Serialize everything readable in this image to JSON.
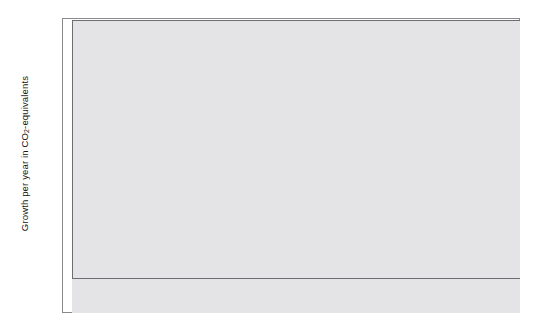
{
  "chart_data": {
    "type": "area",
    "stacked": true,
    "title": "",
    "xlabel": "",
    "ylabel": "Growth per year in CO2-equivalents",
    "ylabel_html": "Growth per year in CO<sub>2</sub>-equivalents",
    "xlim": [
      1850,
      1995
    ],
    "ylim": [
      -0.1,
      0.8
    ],
    "y_tick_labels": [
      "0.8%",
      "0.7%",
      "0.6%",
      "0.5%",
      "0.4%",
      "0.3%",
      "0.2%",
      "0.1%",
      "0.0%",
      "-0.1%"
    ],
    "y_tick_values": [
      0.8,
      0.7,
      0.6,
      0.5,
      0.4,
      0.3,
      0.2,
      0.1,
      0.0,
      -0.1
    ],
    "x_tick_labels": [
      "1860",
      "1870",
      "1880",
      "1890",
      "1900",
      "1910",
      "1920",
      "1930",
      "1940",
      "1950",
      "1960",
      "1970",
      "1980",
      "1990"
    ],
    "x_tick_values": [
      1860,
      1870,
      1880,
      1890,
      1900,
      1910,
      1920,
      1930,
      1940,
      1950,
      1960,
      1970,
      1980,
      1990
    ],
    "grid": "faint-white-horizontal-and-vertical",
    "legend_position": "upper-left-inside",
    "plot_background_color": "#e4e4e6",
    "series": [
      {
        "name": "Carbon dioxide",
        "color": "#ffffff",
        "stack_order": 1,
        "values": [
          0.0,
          -0.012,
          -0.015,
          0.01,
          0.048,
          0.082,
          0.1,
          0.104,
          0.092,
          0.078,
          0.064,
          0.052,
          0.046,
          0.044,
          0.044,
          0.045,
          0.047,
          0.049,
          0.05,
          0.052,
          0.056,
          0.06,
          0.064,
          0.062,
          0.06,
          0.062,
          0.07,
          0.088,
          0.112,
          0.142,
          0.172,
          0.192,
          0.2,
          0.188,
          0.176,
          0.166,
          0.156,
          0.146,
          0.134,
          0.12,
          0.104,
          0.09,
          0.078,
          0.07,
          0.064,
          0.062,
          0.066,
          0.08,
          0.098,
          0.118,
          0.136,
          0.148,
          0.154,
          0.156,
          0.154,
          0.15,
          0.148,
          0.15,
          0.154,
          0.156,
          0.156,
          0.152,
          0.146,
          0.142,
          0.14,
          0.142,
          0.146,
          0.15,
          0.154,
          0.158,
          0.16,
          0.16,
          0.158,
          0.156,
          0.156,
          0.158,
          0.162,
          0.166,
          0.168,
          0.17,
          0.172,
          0.172,
          0.17,
          0.166,
          0.16,
          0.15,
          0.134,
          0.112,
          0.082,
          0.044,
          0.004,
          -0.03,
          -0.048,
          -0.046,
          -0.026,
          0.006,
          0.04,
          0.072,
          0.098,
          0.118,
          0.134,
          0.148,
          0.16,
          0.172,
          0.184,
          0.196,
          0.206,
          0.216,
          0.222,
          0.216,
          0.226,
          0.244,
          0.258,
          0.25,
          0.262,
          0.282,
          0.3,
          0.312,
          0.322,
          0.318,
          0.33,
          0.352,
          0.368,
          0.36,
          0.346,
          0.356,
          0.378,
          0.392,
          0.4,
          0.392,
          0.372,
          0.352,
          0.34,
          0.332,
          0.344,
          0.366,
          0.38,
          0.368,
          0.352,
          0.342,
          0.35,
          0.368,
          0.39,
          0.404,
          0.398,
          0.386
        ]
      },
      {
        "name": "Methane",
        "color": "#d2d2d4",
        "stack_order": 2,
        "values": [
          0.0,
          0.0,
          0.0,
          0.002,
          0.004,
          0.006,
          0.007,
          0.007,
          0.007,
          0.006,
          0.006,
          0.006,
          0.006,
          0.006,
          0.006,
          0.006,
          0.006,
          0.007,
          0.007,
          0.007,
          0.008,
          0.008,
          0.008,
          0.008,
          0.008,
          0.008,
          0.009,
          0.01,
          0.011,
          0.012,
          0.013,
          0.014,
          0.014,
          0.014,
          0.014,
          0.013,
          0.013,
          0.013,
          0.012,
          0.012,
          0.011,
          0.011,
          0.01,
          0.01,
          0.01,
          0.01,
          0.01,
          0.011,
          0.012,
          0.013,
          0.014,
          0.015,
          0.015,
          0.015,
          0.015,
          0.015,
          0.015,
          0.015,
          0.015,
          0.016,
          0.016,
          0.016,
          0.015,
          0.015,
          0.015,
          0.015,
          0.015,
          0.016,
          0.016,
          0.016,
          0.017,
          0.017,
          0.017,
          0.017,
          0.017,
          0.017,
          0.017,
          0.018,
          0.018,
          0.018,
          0.018,
          0.018,
          0.018,
          0.018,
          0.017,
          0.016,
          0.015,
          0.013,
          0.011,
          0.008,
          0.005,
          0.003,
          0.002,
          0.002,
          0.003,
          0.006,
          0.01,
          0.014,
          0.018,
          0.022,
          0.026,
          0.03,
          0.034,
          0.038,
          0.042,
          0.046,
          0.05,
          0.054,
          0.057,
          0.058,
          0.06,
          0.063,
          0.066,
          0.066,
          0.068,
          0.071,
          0.074,
          0.076,
          0.078,
          0.078,
          0.08,
          0.083,
          0.086,
          0.086,
          0.084,
          0.086,
          0.089,
          0.091,
          0.092,
          0.091,
          0.088,
          0.085,
          0.083,
          0.082,
          0.084,
          0.087,
          0.089,
          0.087,
          0.085,
          0.084,
          0.085,
          0.088,
          0.091,
          0.093,
          0.092,
          0.09
        ]
      },
      {
        "name": "Nitrous oxide",
        "color": "#8e8e92",
        "stack_order": 3,
        "values": [
          0.0,
          0.0,
          0.0,
          0.001,
          0.002,
          0.003,
          0.004,
          0.004,
          0.004,
          0.004,
          0.004,
          0.004,
          0.004,
          0.004,
          0.004,
          0.004,
          0.004,
          0.004,
          0.004,
          0.004,
          0.005,
          0.005,
          0.005,
          0.005,
          0.005,
          0.005,
          0.005,
          0.006,
          0.006,
          0.007,
          0.008,
          0.008,
          0.008,
          0.008,
          0.008,
          0.008,
          0.008,
          0.008,
          0.007,
          0.007,
          0.007,
          0.006,
          0.006,
          0.006,
          0.006,
          0.006,
          0.006,
          0.006,
          0.007,
          0.008,
          0.008,
          0.009,
          0.009,
          0.009,
          0.009,
          0.009,
          0.009,
          0.009,
          0.009,
          0.009,
          0.009,
          0.009,
          0.009,
          0.009,
          0.009,
          0.009,
          0.009,
          0.009,
          0.009,
          0.01,
          0.01,
          0.01,
          0.01,
          0.01,
          0.01,
          0.01,
          0.01,
          0.01,
          0.01,
          0.01,
          0.01,
          0.01,
          0.01,
          0.01,
          0.01,
          0.009,
          0.009,
          0.008,
          0.006,
          0.005,
          0.003,
          0.002,
          0.001,
          0.001,
          0.002,
          0.003,
          0.005,
          0.008,
          0.01,
          0.012,
          0.014,
          0.016,
          0.018,
          0.02,
          0.022,
          0.024,
          0.026,
          0.028,
          0.03,
          0.03,
          0.032,
          0.034,
          0.036,
          0.036,
          0.037,
          0.039,
          0.041,
          0.042,
          0.043,
          0.043,
          0.044,
          0.046,
          0.048,
          0.048,
          0.047,
          0.048,
          0.05,
          0.051,
          0.052,
          0.051,
          0.05,
          0.048,
          0.047,
          0.046,
          0.047,
          0.049,
          0.05,
          0.049,
          0.048,
          0.047,
          0.048,
          0.05,
          0.052,
          0.053,
          0.052,
          0.051
        ]
      },
      {
        "name": "CFCs",
        "color": "#111111",
        "stack_order": 4,
        "values": [
          0.0,
          0.0,
          0.0,
          0.0,
          0.0,
          0.0,
          0.0,
          0.0,
          0.0,
          0.0,
          0.0,
          0.0,
          0.0,
          0.0,
          0.0,
          0.0,
          0.0,
          0.0,
          0.0,
          0.0,
          0.0,
          0.0,
          0.0,
          0.0,
          0.0,
          0.0,
          0.0,
          0.0,
          0.0,
          0.0,
          0.0,
          0.0,
          0.0,
          0.0,
          0.0,
          0.0,
          0.0,
          0.0,
          0.0,
          0.0,
          0.0,
          0.0,
          0.0,
          0.0,
          0.0,
          0.0,
          0.0,
          0.0,
          0.0,
          0.0,
          0.0,
          0.0,
          0.0,
          0.0,
          0.0,
          0.0,
          0.0,
          0.0,
          0.0,
          0.0,
          0.0,
          0.0,
          0.0,
          0.0,
          0.0,
          0.0,
          0.0,
          0.0,
          0.0,
          0.0,
          0.0,
          0.0,
          0.0,
          0.0,
          0.0,
          0.0,
          0.0,
          0.0,
          0.0,
          0.0,
          0.0,
          0.0,
          0.0,
          0.0,
          0.0,
          0.0,
          0.0,
          0.0,
          0.0,
          0.0,
          0.0,
          0.0,
          0.0,
          0.0,
          0.0,
          0.0,
          0.0,
          0.0,
          0.0,
          0.0,
          0.002,
          0.004,
          0.007,
          0.012,
          0.018,
          0.026,
          0.036,
          0.048,
          0.058,
          0.07,
          0.084,
          0.1,
          0.114,
          0.118,
          0.134,
          0.152,
          0.168,
          0.178,
          0.192,
          0.202,
          0.216,
          0.234,
          0.25,
          0.248,
          0.238,
          0.252,
          0.268,
          0.28,
          0.288,
          0.28,
          0.262,
          0.244,
          0.232,
          0.224,
          0.236,
          0.252,
          0.262,
          0.248,
          0.23,
          0.212,
          0.196,
          0.182,
          0.172,
          0.166,
          0.158,
          0.15
        ]
      }
    ],
    "legend": [
      {
        "label": "CFCs",
        "color": "#111111"
      },
      {
        "label": "Nitrous oxide",
        "color": "#8e8e92"
      },
      {
        "label": "Methane",
        "color": "#d2d2d4"
      },
      {
        "label": "Carbon dioxide",
        "color": "#fbfbfb"
      }
    ]
  }
}
